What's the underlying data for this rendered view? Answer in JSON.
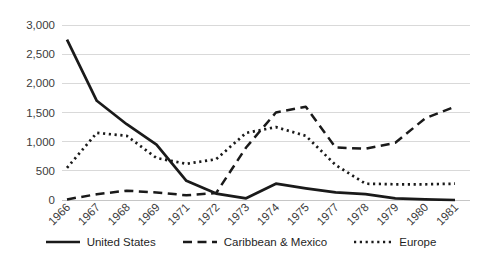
{
  "chart_data": {
    "type": "line",
    "title": "",
    "xlabel": "",
    "ylabel": "",
    "categories": [
      "1966",
      "1967",
      "1968",
      "1969",
      "1971",
      "1972",
      "1973",
      "1974",
      "1975",
      "1977",
      "1978",
      "1979",
      "1980",
      "1981"
    ],
    "series": [
      {
        "name": "United States",
        "line_style": "solid",
        "values": [
          2750,
          1700,
          1300,
          950,
          330,
          110,
          30,
          280,
          200,
          130,
          100,
          30,
          10,
          0
        ]
      },
      {
        "name": "Caribbean & Mexico",
        "line_style": "dashed",
        "values": [
          10,
          100,
          160,
          130,
          80,
          120,
          900,
          1500,
          1600,
          900,
          880,
          980,
          1400,
          1600
        ]
      },
      {
        "name": "Europe",
        "line_style": "dotted",
        "values": [
          550,
          1150,
          1100,
          720,
          620,
          700,
          1150,
          1250,
          1100,
          600,
          280,
          270,
          270,
          280
        ]
      }
    ],
    "ylim": [
      0,
      3000
    ],
    "ytick_interval": 500,
    "ytick_labels": [
      "0",
      "500",
      "1,000",
      "1,500",
      "2,000",
      "2,500",
      "3,000"
    ],
    "grid": true,
    "legend_position": "bottom",
    "line_color": "#1a1a1a",
    "grid_color": "#d9d9d9",
    "label_color": "#3b3b3b",
    "background_color": "#ffffff"
  }
}
